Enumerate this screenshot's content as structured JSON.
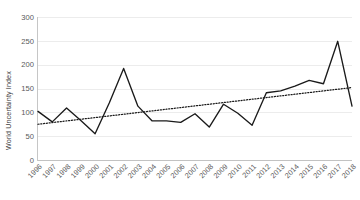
{
  "chart_data": {
    "type": "line",
    "title": "",
    "xlabel": "",
    "ylabel": "World Uncertainty Index",
    "ylim": [
      0,
      300
    ],
    "ytick_labels": [
      "0",
      "50",
      "100",
      "150",
      "200",
      "250",
      "300"
    ],
    "yticks": [
      0,
      50,
      100,
      150,
      200,
      250,
      300
    ],
    "grid": true,
    "legend": "none",
    "categories": [
      "1996",
      "1997",
      "1998",
      "1999",
      "2000",
      "2001",
      "2002",
      "2003",
      "2004",
      "2005",
      "2006",
      "2007",
      "2008",
      "2009",
      "2010",
      "2011",
      "2012",
      "2013",
      "2014",
      "2015",
      "2016",
      "2017",
      "2018"
    ],
    "series": [
      {
        "name": "World Uncertainty Index",
        "style": "solid",
        "values": [
          102,
          80,
          109,
          83,
          55,
          120,
          192,
          113,
          82,
          82,
          79,
          97,
          69,
          117,
          98,
          73,
          141,
          145,
          155,
          167,
          160,
          249,
          113
        ]
      },
      {
        "name": "Linear trend",
        "style": "dotted",
        "values": [
          75,
          78.5,
          82,
          85.5,
          89,
          92.5,
          96,
          99.5,
          103,
          106.5,
          110,
          113.5,
          117,
          120.5,
          124,
          127.5,
          131,
          134.5,
          138,
          141.5,
          145,
          148.5,
          152
        ]
      }
    ],
    "annotations": []
  }
}
